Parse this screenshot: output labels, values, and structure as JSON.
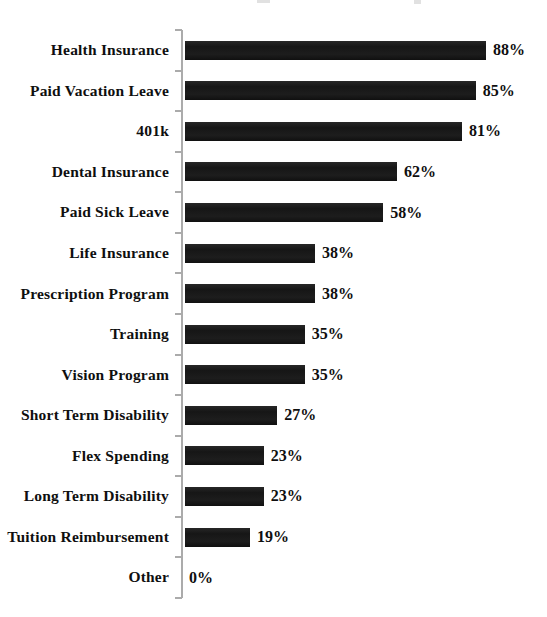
{
  "chart_data": {
    "type": "bar",
    "orientation": "horizontal",
    "title": "",
    "categories": [
      "Health Insurance",
      "Paid Vacation Leave",
      "401k",
      "Dental Insurance",
      "Paid Sick Leave",
      "Life Insurance",
      "Prescription Program",
      "Training",
      "Vision Program",
      "Short Term Disability",
      "Flex Spending",
      "Long Term Disability",
      "Tuition Reimbursement",
      "Other"
    ],
    "values": [
      88,
      85,
      81,
      62,
      58,
      38,
      38,
      35,
      35,
      27,
      23,
      23,
      19,
      0
    ],
    "value_labels": [
      "88%",
      "85%",
      "81%",
      "62%",
      "58%",
      "38%",
      "38%",
      "35%",
      "35%",
      "27%",
      "23%",
      "23%",
      "19%",
      "0%"
    ],
    "xlabel": "",
    "ylabel": "",
    "xlim": [
      0,
      100
    ],
    "grid": false,
    "legend": false,
    "value_label_position": "right-of-bar",
    "bar_color": "#1a1a1a",
    "axis_color": "#ababab",
    "text_color": "#0f0f0f",
    "background": "#ffffff"
  }
}
